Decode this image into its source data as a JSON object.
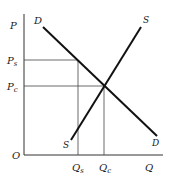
{
  "diagram": {
    "type": "supply-demand",
    "axes": {
      "y_label": "P",
      "x_label": "Q",
      "origin_label": "O"
    },
    "curves": {
      "demand": {
        "label_top": "D",
        "label_bottom": "D"
      },
      "supply": {
        "label_top": "S",
        "label_bottom": "S"
      }
    },
    "price_levels": [
      {
        "main": "P",
        "sub": "s"
      },
      {
        "main": "P",
        "sub": "c"
      }
    ],
    "quantity_levels": [
      {
        "main": "Q",
        "sub": "s"
      },
      {
        "main": "Q",
        "sub": "c"
      }
    ],
    "colors": {
      "curve": "#111111",
      "axis": "#333333",
      "guide": "#444444"
    }
  }
}
